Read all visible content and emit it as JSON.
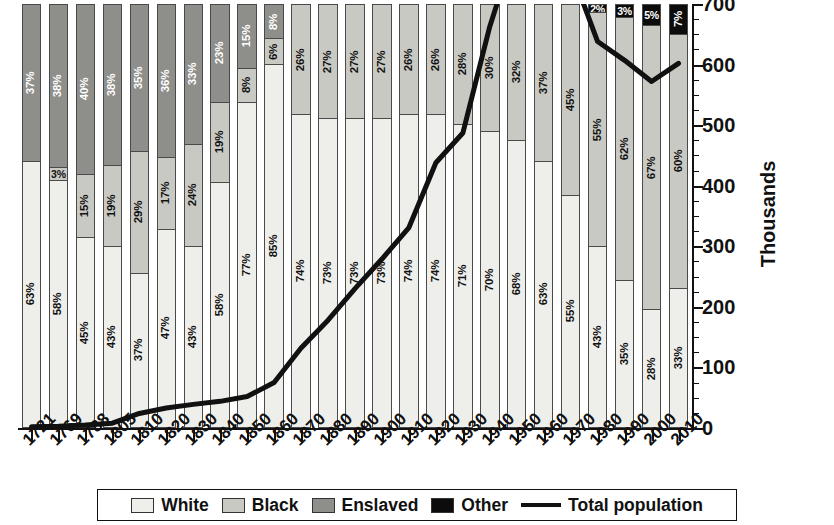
{
  "chart": {
    "type": "bar",
    "y_axis_title": "Thousands"
  },
  "legend": {
    "items": [
      {
        "label": "White",
        "color": "#eeeeea",
        "kind": "swatch"
      },
      {
        "label": "Black",
        "color": "#c9c9c4",
        "kind": "swatch"
      },
      {
        "label": "Enslaved",
        "color": "#8e8e8a",
        "kind": "swatch"
      },
      {
        "label": "Other",
        "color": "#0c0c0c",
        "kind": "swatch"
      },
      {
        "label": "Total population",
        "color": "#111111",
        "kind": "line"
      }
    ]
  },
  "chart_data": {
    "type": "bar",
    "title": "",
    "subtitle": "",
    "xlabel": "",
    "ylabel": "Thousands",
    "ylim": [
      0,
      700
    ],
    "ytick_values": [
      0,
      100,
      200,
      300,
      400,
      500,
      600,
      700
    ],
    "ytick_labels": [
      "0",
      "100",
      "200",
      "300",
      "400",
      "500",
      "600",
      "700"
    ],
    "yminor_step": 25,
    "grid": false,
    "legend_position": "bottom",
    "stacked": true,
    "stack_normalized_percent": true,
    "categories": [
      "1721",
      "1769",
      "1788",
      "1805",
      "1810",
      "1820",
      "1830",
      "1840",
      "1850",
      "1860",
      "1870",
      "1880",
      "1890",
      "1900",
      "1910",
      "1920",
      "1930",
      "1940",
      "1950",
      "1960",
      "1970",
      "1980",
      "1990",
      "2000",
      "2010"
    ],
    "series": [
      {
        "name": "White",
        "color": "#eeeeea",
        "values": [
          63,
          58,
          45,
          43,
          37,
          47,
          43,
          58,
          77,
          85,
          74,
          73,
          73,
          73,
          74,
          74,
          71,
          70,
          68,
          63,
          55,
          43,
          35,
          28,
          33
        ],
        "labels": [
          "63%",
          "58%",
          "45%",
          "43%",
          "37%",
          "47%",
          "43%",
          "58%",
          "77%",
          "85%",
          "74%",
          "73%",
          "73%",
          "73%",
          "74%",
          "74%",
          "71%",
          "70%",
          "68%",
          "63%",
          "55%",
          "43%",
          "35%",
          "28%",
          "33%"
        ]
      },
      {
        "name": "Black",
        "color": "#c9c9c4",
        "values": [
          0,
          3,
          15,
          19,
          29,
          17,
          24,
          19,
          8,
          6,
          26,
          27,
          27,
          27,
          26,
          26,
          28,
          30,
          32,
          37,
          45,
          55,
          62,
          67,
          60
        ],
        "labels": [
          "",
          "3%",
          "15%",
          "19%",
          "29%",
          "17%",
          "24%",
          "19%",
          "8%",
          "6%",
          "26%",
          "27%",
          "27%",
          "27%",
          "26%",
          "26%",
          "28%",
          "30%",
          "32%",
          "37%",
          "45%",
          "55%",
          "62%",
          "67%",
          "60%"
        ]
      },
      {
        "name": "Enslaved",
        "color": "#8e8e8a",
        "values": [
          37,
          38,
          40,
          38,
          35,
          36,
          33,
          23,
          15,
          8,
          0,
          0,
          0,
          0,
          0,
          0,
          0,
          0,
          0,
          0,
          0,
          0,
          0,
          0,
          0
        ],
        "labels": [
          "37%",
          "38%",
          "40%",
          "38%",
          "35%",
          "36%",
          "33%",
          "23%",
          "15%",
          "8%",
          "",
          "",
          "",
          "",
          "",
          "",
          "",
          "",
          "",
          "",
          "",
          "",
          "",
          "",
          ""
        ]
      },
      {
        "name": "Other",
        "color": "#0c0c0c",
        "values": [
          0,
          0,
          0,
          0,
          0,
          0,
          0,
          0,
          0,
          0,
          0,
          0,
          0,
          0,
          0,
          0,
          0,
          0,
          0,
          0,
          0,
          2,
          3,
          5,
          7
        ],
        "labels": [
          "",
          "",
          "",
          "",
          "",
          "",
          "",
          "",
          "",
          "",
          "",
          "",
          "",
          "",
          "",
          "",
          "",
          "",
          "",
          "",
          "",
          "2%",
          "3%",
          "5%",
          "7%"
        ]
      }
    ],
    "line_series": {
      "name": "Total population",
      "color": "#111111",
      "units": "thousands",
      "x": [
        "1721",
        "1769",
        "1788",
        "1805",
        "1810",
        "1820",
        "1830",
        "1840",
        "1850",
        "1860",
        "1870",
        "1880",
        "1890",
        "1900",
        "1910",
        "1920",
        "1930",
        "1940",
        "1950",
        "1960",
        "1970",
        "1980",
        "1990",
        "2000",
        "2010"
      ],
      "values": [
        2,
        3,
        5,
        8,
        24,
        33,
        39,
        44,
        52,
        75,
        132,
        178,
        230,
        279,
        331,
        438,
        487,
        663,
        802,
        764,
        757,
        638,
        607,
        572,
        602
      ]
    }
  }
}
